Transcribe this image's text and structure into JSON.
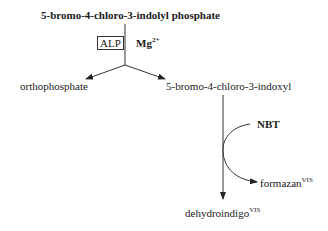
{
  "diagram": {
    "substrate": "5-bromo-4-chloro-3-indolyl phosphate",
    "enzyme": "ALP",
    "cofactor": {
      "base": "Mg",
      "charge": "2+"
    },
    "products": {
      "left": "orthophosphate",
      "right": "5-bromo-4-chloro-3-indoxyl"
    },
    "reagent": "NBT",
    "side_product": {
      "name": "formazan",
      "tag": "VIS"
    },
    "final_product": {
      "name": "dehydroindigo",
      "tag": "VIS"
    }
  },
  "colors": {
    "ink": "#1a1a1a",
    "line": "#333333",
    "background": "#ffffff"
  }
}
